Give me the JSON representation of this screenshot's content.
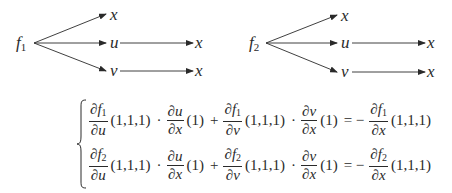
{
  "diagrams": [
    {
      "root": {
        "var": "f",
        "sub": "1"
      },
      "branches": [
        {
          "node": "x"
        },
        {
          "node": "u",
          "child": "x"
        },
        {
          "node": "v",
          "child": "x"
        }
      ]
    },
    {
      "root": {
        "var": "f",
        "sub": "2"
      },
      "branches": [
        {
          "node": "x"
        },
        {
          "node": "u",
          "child": "x"
        },
        {
          "node": "v",
          "child": "x"
        }
      ]
    }
  ],
  "system": {
    "rows": [
      {
        "t1": {
          "num_pre": "∂f",
          "num_sub": "1",
          "den": "∂u"
        },
        "a1": "(1,1,1)",
        "dot1": "·",
        "t2": {
          "num": "∂u",
          "den": "∂x"
        },
        "a2": "(1)",
        "plus": "+",
        "t3": {
          "num_pre": "∂f",
          "num_sub": "1",
          "den": "∂v"
        },
        "a3": "(1,1,1)",
        "dot2": "·",
        "t4": {
          "num": "∂v",
          "den": "∂x"
        },
        "a4": "(1)",
        "eq": "= −",
        "t5": {
          "num_pre": "∂f",
          "num_sub": "1",
          "den": "∂x"
        },
        "a5": "(1,1,1)"
      },
      {
        "t1": {
          "num_pre": "∂f",
          "num_sub": "2",
          "den": "∂u"
        },
        "a1": "(1,1,1)",
        "dot1": "·",
        "t2": {
          "num": "∂u",
          "den": "∂x"
        },
        "a2": "(1)",
        "plus": "+",
        "t3": {
          "num_pre": "∂f",
          "num_sub": "2",
          "den": "∂v"
        },
        "a3": "(1,1,1)",
        "dot2": "·",
        "t4": {
          "num": "∂v",
          "den": "∂x"
        },
        "a4": "(1)",
        "eq": "= −",
        "t5": {
          "num_pre": "∂f",
          "num_sub": "2",
          "den": "∂x"
        },
        "a5": "(1,1,1)"
      }
    ]
  }
}
